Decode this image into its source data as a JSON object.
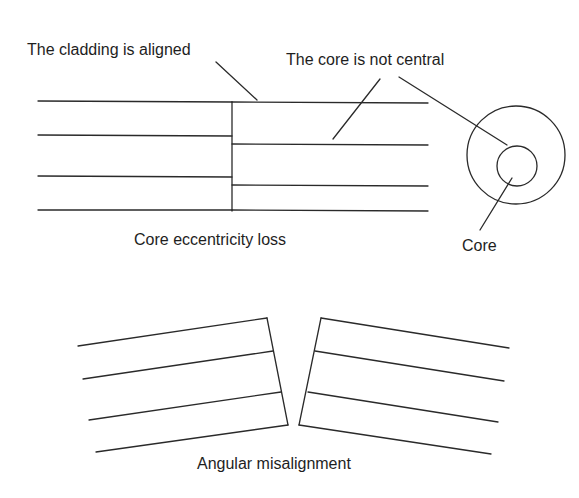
{
  "diagram": {
    "core_eccentricity": {
      "caption": "Core eccentricity loss",
      "labels": {
        "cladding_aligned": "The cladding is aligned",
        "core_not_central": "The core is not central",
        "core": "Core"
      }
    },
    "angular_misalignment": {
      "caption": "Angular misalignment"
    },
    "colors": {
      "line": "#2a2a2a",
      "text": "#1e1e1e",
      "background": "#ffffff"
    }
  }
}
